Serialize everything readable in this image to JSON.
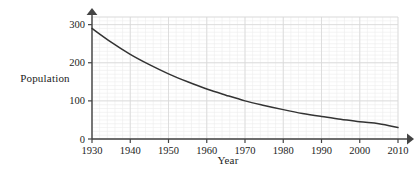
{
  "chart_data": {
    "type": "line",
    "title": "",
    "xlabel": "Year",
    "ylabel": "Population",
    "xlim": [
      1930,
      2010
    ],
    "ylim": [
      0,
      320
    ],
    "grid": true,
    "legend": "none",
    "x_ticks": [
      1930,
      1940,
      1950,
      1960,
      1970,
      1980,
      1990,
      2000,
      2010
    ],
    "x_tick_labels": [
      "1930",
      "1940",
      "1950",
      "1960",
      "1970",
      "1980",
      "1990",
      "2000",
      "2010"
    ],
    "y_ticks": [
      0,
      100,
      200,
      300
    ],
    "y_tick_labels": [
      "0",
      "100",
      "200",
      "300"
    ],
    "minor_grid_x_step": 2,
    "minor_grid_y_step": 10,
    "series": [
      {
        "name": "Population",
        "color": "#333333",
        "x": [
          1930,
          1935,
          1940,
          1945,
          1950,
          1955,
          1960,
          1965,
          1970,
          1975,
          1980,
          1985,
          1990,
          1995,
          2000,
          2005,
          2010
        ],
        "values": [
          290,
          254,
          222,
          195,
          171,
          150,
          131,
          115,
          100,
          88,
          77,
          67,
          59,
          52,
          45,
          40,
          30
        ]
      }
    ]
  },
  "labels": {
    "y_axis_title": "Population",
    "x_axis_title": "Year"
  },
  "style": {
    "curve_color": "#333333",
    "axis_color": "#444444",
    "grid_major_color": "#d8d8d8",
    "grid_minor_color": "#ececec",
    "background": "#ffffff",
    "text_color": "#1c1c1c"
  }
}
